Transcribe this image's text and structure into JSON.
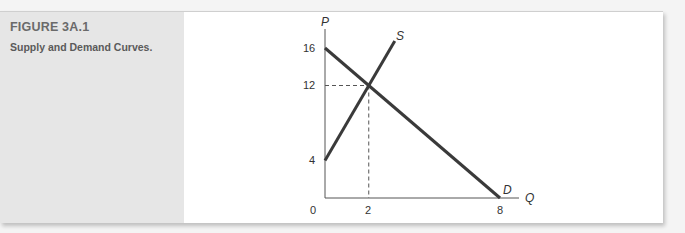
{
  "figure": {
    "number": "FIGURE 3A.1",
    "title": "Supply and Demand Curves."
  },
  "chart_data": {
    "type": "line",
    "title": "Supply and Demand Curves.",
    "xlabel": "Q",
    "ylabel": "P",
    "xlim": [
      0,
      8
    ],
    "ylim": [
      0,
      16
    ],
    "x_ticks": [
      "0",
      "2",
      "8"
    ],
    "y_ticks": [
      "4",
      "12",
      "16"
    ],
    "grid": false,
    "series": [
      {
        "name": "S",
        "label": "S",
        "points": [
          [
            0,
            4
          ],
          [
            3.19,
            16.75
          ]
        ],
        "color": "#3a3a3a"
      },
      {
        "name": "D",
        "label": "D",
        "points": [
          [
            0,
            16
          ],
          [
            8,
            0
          ]
        ],
        "color": "#3a3a3a"
      }
    ],
    "equilibrium": {
      "Q": 2,
      "P": 12,
      "guides": "dashed"
    }
  }
}
